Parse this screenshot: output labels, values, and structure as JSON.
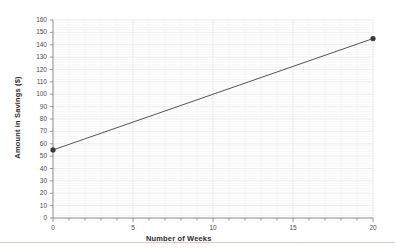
{
  "chart_data": {
    "type": "line",
    "title": "",
    "subtitle": "",
    "xlabel": "Number of Weeks",
    "ylabel": "Amount in Savings ($)",
    "xlim": [
      0,
      20
    ],
    "ylim": [
      0,
      160
    ],
    "x_ticks": [
      0,
      5,
      10,
      15,
      20
    ],
    "x_tick_labels": [
      "0",
      "5",
      "10",
      "15",
      "20"
    ],
    "x_minor_tick_step": 1,
    "y_ticks": [
      0,
      10,
      20,
      30,
      40,
      50,
      60,
      70,
      80,
      90,
      100,
      110,
      120,
      130,
      140,
      150,
      160
    ],
    "y_tick_labels": [
      "0",
      "10",
      "20",
      "30",
      "40",
      "50",
      "60",
      "70",
      "80",
      "90",
      "100",
      "110",
      "120",
      "130",
      "140",
      "150",
      "160"
    ],
    "grid": true,
    "grid_color": "#f2f2f2",
    "legend": false,
    "legend_position": "none",
    "series": [
      {
        "name": "Savings",
        "x": [
          0,
          20
        ],
        "values": [
          55,
          145
        ],
        "line_color": "#555555",
        "marker": "circle",
        "marker_color": "#3a3a3a",
        "points": [
          {
            "x": 0,
            "y": 55
          },
          {
            "x": 20,
            "y": 145
          }
        ]
      }
    ],
    "annotations": []
  },
  "figure": {
    "background_color": "#ffffff",
    "axis_color": "#8a8a8a",
    "bottom_rule_color": "#d8cbbc"
  }
}
